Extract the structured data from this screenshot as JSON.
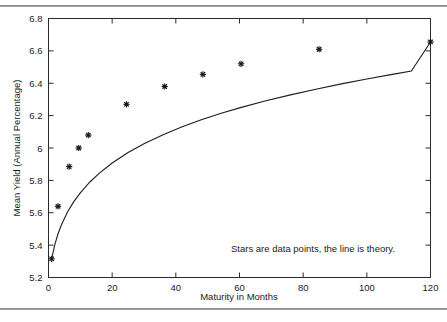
{
  "figure": {
    "name": "mean-yield-vs-maturity-scatter",
    "background_color": "#ffffff",
    "ink_color": "#1a1a1a"
  },
  "chart_data": {
    "type": "scatter",
    "title": "",
    "xlabel": "Maturity in Months",
    "ylabel": "Mean Yield (Annual Percentage)",
    "xlim": [
      0,
      120
    ],
    "ylim": [
      5.2,
      6.8
    ],
    "xticks": [
      0,
      20,
      40,
      60,
      80,
      100,
      120
    ],
    "xticklabels": [
      "0",
      "20",
      "40",
      "60",
      "80",
      "100",
      "120"
    ],
    "yticks": [
      5.2,
      5.4,
      5.6,
      5.8,
      6.0,
      6.2,
      6.4,
      6.6,
      6.8
    ],
    "yticklabels": [
      "5.2",
      "5.4",
      "5.6",
      "5.8",
      "6",
      "6.2",
      "6.4",
      "6.6",
      "6.8"
    ],
    "grid": false,
    "legend": null,
    "annotations": [
      {
        "text": "Stars are data points, the line is theory.",
        "x": 58,
        "y": 5.35
      }
    ],
    "series": [
      {
        "name": "Data points",
        "marker": "star",
        "type": "scatter",
        "x": [
          1,
          3,
          6.5,
          9.5,
          12.5,
          24.5,
          36.5,
          48.5,
          60.5,
          85,
          120
        ],
        "y": [
          5.315,
          5.64,
          5.885,
          6.0,
          6.08,
          6.27,
          6.38,
          6.455,
          6.52,
          6.61,
          6.655
        ]
      },
      {
        "name": "Theory",
        "marker": "none",
        "type": "line",
        "x": [
          1,
          2,
          3,
          4,
          6,
          8,
          10,
          13,
          16,
          20,
          25,
          30,
          36,
          42,
          48,
          54,
          60,
          68,
          76,
          84,
          92,
          100,
          108,
          114,
          120
        ],
        "y": [
          5.315,
          5.405,
          5.47,
          5.523,
          5.606,
          5.67,
          5.723,
          5.79,
          5.845,
          5.907,
          5.972,
          6.026,
          6.082,
          6.131,
          6.174,
          6.213,
          6.248,
          6.29,
          6.328,
          6.363,
          6.396,
          6.426,
          6.455,
          6.475,
          6.655
        ]
      }
    ]
  }
}
